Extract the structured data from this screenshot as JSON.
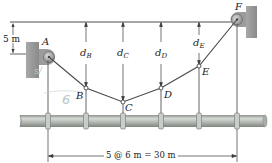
{
  "figure": {
    "colors": {
      "line": "#3a3a3a",
      "wall": "#9a9a9a",
      "pipe": "#b7bcb8",
      "pipe_dark": "#8c918d",
      "background": "#ffffff",
      "handwriting": "#b9c6c6"
    },
    "points": [
      {
        "id": "A",
        "label": "A"
      },
      {
        "id": "B",
        "label": "B"
      },
      {
        "id": "C",
        "label": "C"
      },
      {
        "id": "D",
        "label": "D"
      },
      {
        "id": "E",
        "label": "E"
      },
      {
        "id": "F",
        "label": "F"
      }
    ],
    "sag_labels": {
      "B": {
        "base": "d",
        "sub": "B"
      },
      "C": {
        "base": "d",
        "sub": "C"
      },
      "D": {
        "base": "d",
        "sub": "D"
      },
      "E": {
        "base": "d",
        "sub": "E"
      }
    },
    "dimensions": {
      "height_offset": "5 m",
      "span": "5 @ 6 m = 30 m"
    },
    "annotations": {
      "handwritten_1": "6",
      "handwritten_2": "s/"
    }
  }
}
